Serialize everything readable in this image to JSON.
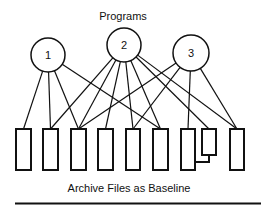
{
  "diagram": {
    "title": "Programs",
    "caption": "Archive Files as Baseline",
    "programs": [
      {
        "id": "p1",
        "label": "1",
        "cx": 48,
        "cy": 55,
        "r": 17
      },
      {
        "id": "p2",
        "label": "2",
        "cx": 124,
        "cy": 45,
        "r": 17
      },
      {
        "id": "p3",
        "label": "3",
        "cx": 191,
        "cy": 53,
        "r": 18
      }
    ],
    "files": [
      {
        "id": "f1",
        "x": 16,
        "y": 129,
        "w": 15,
        "h": 41
      },
      {
        "id": "f2",
        "x": 43,
        "y": 129,
        "w": 15,
        "h": 41
      },
      {
        "id": "f3",
        "x": 71,
        "y": 129,
        "w": 15,
        "h": 41
      },
      {
        "id": "f4",
        "x": 98,
        "y": 129,
        "w": 15,
        "h": 41
      },
      {
        "id": "f5",
        "x": 126,
        "y": 129,
        "w": 14,
        "h": 41
      },
      {
        "id": "f6",
        "x": 153,
        "y": 129,
        "w": 15,
        "h": 41
      },
      {
        "id": "f7",
        "x": 181,
        "y": 129,
        "w": 14,
        "h": 41
      },
      {
        "id": "f8",
        "x": 202,
        "y": 129,
        "w": 14,
        "h": 26
      },
      {
        "id": "f9",
        "x": 230,
        "y": 129,
        "w": 14,
        "h": 41
      }
    ],
    "edges": [
      {
        "from": "p1",
        "to": "f1"
      },
      {
        "from": "p1",
        "to": "f2"
      },
      {
        "from": "p1",
        "to": "f3"
      },
      {
        "from": "p1",
        "to": "f6"
      },
      {
        "from": "p2",
        "to": "f2"
      },
      {
        "from": "p2",
        "to": "f3"
      },
      {
        "from": "p2",
        "to": "f4"
      },
      {
        "from": "p2",
        "to": "f5"
      },
      {
        "from": "p2",
        "to": "f6"
      },
      {
        "from": "p2",
        "to": "f8"
      },
      {
        "from": "p2",
        "to": "f9"
      },
      {
        "from": "p3",
        "to": "f3"
      },
      {
        "from": "p3",
        "to": "f5"
      },
      {
        "from": "p3",
        "to": "f7"
      },
      {
        "from": "p3",
        "to": "f9"
      }
    ],
    "linked_file": {
      "from": "f8",
      "to": "f7"
    },
    "colors": {
      "stroke": "#111111",
      "background": "#ffffff"
    }
  }
}
